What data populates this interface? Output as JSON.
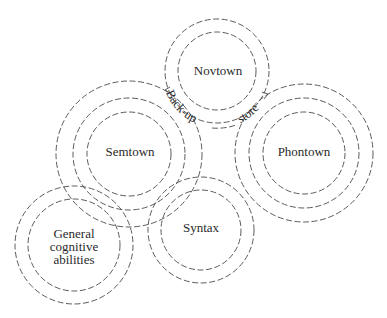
{
  "diagram": {
    "type": "concentric-dashed-circles",
    "line_color": "#4a4a4a",
    "text_color": "#2a2a2a",
    "nodes": [
      {
        "id": "novtown",
        "label": "Novtown",
        "center": [
          217,
          71
        ],
        "radii": [
          52,
          39
        ]
      },
      {
        "id": "semtown",
        "label": "Semtown",
        "center": [
          129,
          154
        ],
        "radii": [
          73,
          56,
          42
        ]
      },
      {
        "id": "phontown",
        "label": "Phontown",
        "center": [
          304,
          153
        ],
        "radii": [
          69,
          55,
          41
        ]
      },
      {
        "id": "general",
        "label_lines": [
          "General",
          "cognitive",
          "abilities"
        ],
        "center": [
          74,
          245
        ],
        "radii": [
          59,
          46
        ]
      },
      {
        "id": "syntax",
        "label": "Syntax",
        "center": [
          201,
          230
        ],
        "radii": [
          53,
          40
        ]
      }
    ],
    "connector": {
      "description": "Curved arrow along outer Novtown circle linking Semtown and Phontown",
      "label_left": "Back-up",
      "label_right": "store"
    }
  }
}
